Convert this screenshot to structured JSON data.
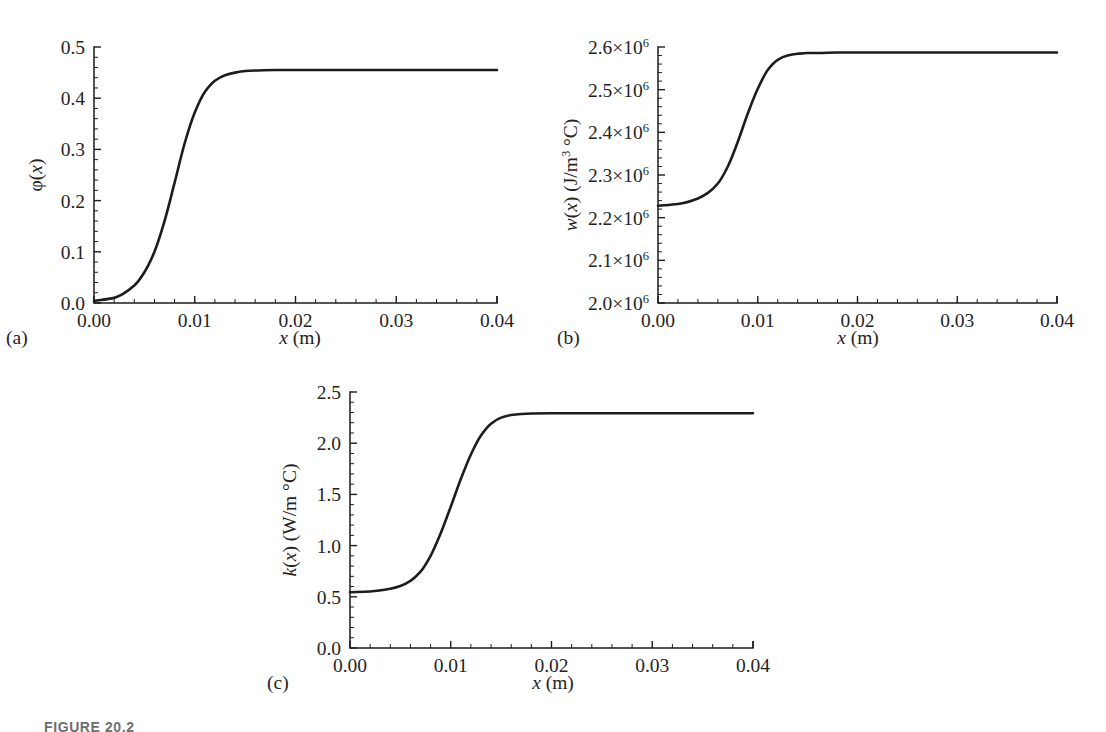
{
  "figure": {
    "caption_label": "FIGURE 20.2",
    "background_color": "#ffffff",
    "curve_color": "#1c1c1c",
    "axis_color": "#1c1c1c"
  },
  "panels": [
    {
      "id": "a",
      "letter": "(a)",
      "ylabel_plain": "φ(x)",
      "xlabel_plain": "x (m)"
    },
    {
      "id": "b",
      "letter": "(b)",
      "ylabel_plain": "w(x) (J/m³ °C)",
      "xlabel_plain": "x (m)"
    },
    {
      "id": "c",
      "letter": "(c)",
      "ylabel_plain": "k(x) (W/m °C)",
      "xlabel_plain": "x (m)"
    }
  ],
  "chart_data": [
    {
      "type": "line",
      "panel": "a",
      "title": "",
      "xlabel": "x (m)",
      "ylabel": "φ(x)",
      "xlim": [
        0.0,
        0.04
      ],
      "ylim": [
        0.0,
        0.5
      ],
      "xticks": [
        0.0,
        0.01,
        0.02,
        0.03,
        0.04
      ],
      "xticklabels": [
        "0.00",
        "0.01",
        "0.02",
        "0.03",
        "0.04"
      ],
      "yticks": [
        0.0,
        0.1,
        0.2,
        0.3,
        0.4,
        0.5
      ],
      "yticklabels": [
        "0.0",
        "0.1",
        "0.2",
        "0.3",
        "0.4",
        "0.5"
      ],
      "minor_ticks_per_major_x": 4,
      "minor_ticks_per_major_y": 4,
      "grid": false,
      "legend": "none",
      "series": [
        {
          "name": "phi(x)",
          "x": [
            0.0,
            0.002,
            0.004,
            0.005,
            0.006,
            0.007,
            0.008,
            0.009,
            0.01,
            0.011,
            0.012,
            0.013,
            0.014,
            0.015,
            0.016,
            0.018,
            0.02,
            0.025,
            0.03,
            0.035,
            0.04
          ],
          "y": [
            0.004,
            0.01,
            0.034,
            0.06,
            0.1,
            0.16,
            0.235,
            0.312,
            0.372,
            0.412,
            0.434,
            0.445,
            0.45,
            0.453,
            0.454,
            0.455,
            0.455,
            0.455,
            0.455,
            0.455,
            0.455
          ]
        }
      ]
    },
    {
      "type": "line",
      "panel": "b",
      "title": "",
      "xlabel": "x (m)",
      "ylabel": "w(x) (J/m³ °C)",
      "xlim": [
        0.0,
        0.04
      ],
      "ylim": [
        2000000,
        2600000
      ],
      "xticks": [
        0.0,
        0.01,
        0.02,
        0.03,
        0.04
      ],
      "xticklabels": [
        "0.00",
        "0.01",
        "0.02",
        "0.03",
        "0.04"
      ],
      "yticks": [
        2000000,
        2100000,
        2200000,
        2300000,
        2400000,
        2500000,
        2600000
      ],
      "yticklabels": [
        "2.0×10⁶",
        "2.1×10⁶",
        "2.2×10⁶",
        "2.3×10⁶",
        "2.4×10⁶",
        "2.5×10⁶",
        "2.6×10⁶"
      ],
      "minor_ticks_per_major_x": 4,
      "minor_ticks_per_major_y": 4,
      "grid": false,
      "legend": "none",
      "series": [
        {
          "name": "w(x)",
          "x": [
            0.0,
            0.002,
            0.004,
            0.005,
            0.006,
            0.007,
            0.008,
            0.009,
            0.01,
            0.011,
            0.012,
            0.013,
            0.014,
            0.015,
            0.016,
            0.018,
            0.02,
            0.025,
            0.03,
            0.035,
            0.04
          ],
          "y": [
            2228000,
            2232000,
            2245000,
            2258000,
            2280000,
            2320000,
            2378000,
            2444000,
            2502000,
            2546000,
            2570000,
            2580000,
            2584000,
            2586000,
            2586000,
            2587000,
            2587000,
            2587000,
            2587000,
            2587000,
            2587000
          ]
        }
      ]
    },
    {
      "type": "line",
      "panel": "c",
      "title": "",
      "xlabel": "x (m)",
      "ylabel": "k(x) (W/m °C)",
      "xlim": [
        0.0,
        0.04
      ],
      "ylim": [
        0.0,
        2.5
      ],
      "xticks": [
        0.0,
        0.01,
        0.02,
        0.03,
        0.04
      ],
      "xticklabels": [
        "0.00",
        "0.01",
        "0.02",
        "0.03",
        "0.04"
      ],
      "yticks": [
        0.0,
        0.5,
        1.0,
        1.5,
        2.0,
        2.5
      ],
      "yticklabels": [
        "0.0",
        "0.5",
        "1.0",
        "1.5",
        "2.0",
        "2.5"
      ],
      "minor_ticks_per_major_x": 4,
      "minor_ticks_per_major_y": 4,
      "grid": false,
      "legend": "none",
      "series": [
        {
          "name": "k(x)",
          "x": [
            0.0,
            0.002,
            0.004,
            0.005,
            0.006,
            0.007,
            0.008,
            0.009,
            0.01,
            0.011,
            0.012,
            0.013,
            0.014,
            0.015,
            0.016,
            0.017,
            0.018,
            0.02,
            0.025,
            0.03,
            0.035,
            0.04
          ],
          "y": [
            0.545,
            0.552,
            0.578,
            0.605,
            0.655,
            0.745,
            0.9,
            1.12,
            1.38,
            1.65,
            1.89,
            2.075,
            2.19,
            2.25,
            2.275,
            2.285,
            2.29,
            2.292,
            2.292,
            2.292,
            2.292,
            2.292
          ]
        }
      ]
    }
  ]
}
